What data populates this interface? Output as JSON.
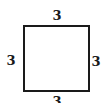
{
  "diagram": {
    "shape": "square",
    "side_labels": {
      "top": "3",
      "left": "3",
      "right": "3",
      "bottom": "3"
    },
    "colors": {
      "stroke": "#1a1a1a",
      "fill": "#ffffff",
      "background": "#ffffff"
    }
  }
}
